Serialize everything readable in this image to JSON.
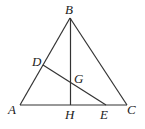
{
  "figure": {
    "type": "geometry-diagram",
    "points": {
      "A": {
        "label": "A",
        "x": 20,
        "y": 105
      },
      "B": {
        "label": "B",
        "x": 70,
        "y": 18
      },
      "C": {
        "label": "C",
        "x": 127,
        "y": 105
      },
      "D": {
        "label": "D",
        "x": 43,
        "y": 65
      },
      "E": {
        "label": "E",
        "x": 106,
        "y": 105
      },
      "G": {
        "label": "G",
        "x": 71,
        "y": 84
      },
      "H": {
        "label": "H",
        "x": 71,
        "y": 105
      }
    },
    "segments": [
      [
        "A",
        "B"
      ],
      [
        "B",
        "C"
      ],
      [
        "A",
        "C"
      ],
      [
        "B",
        "H"
      ],
      [
        "D",
        "E"
      ]
    ],
    "labels": [
      "A",
      "B",
      "C",
      "D",
      "E",
      "G",
      "H"
    ]
  }
}
